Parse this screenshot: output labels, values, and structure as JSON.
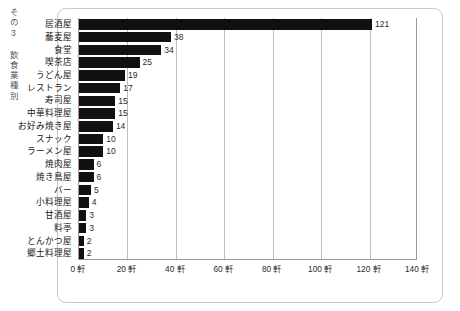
{
  "figure": {
    "side_caption": "その3 飲食業種別",
    "frame_color": "#c9c9c9",
    "bar_color": "#111111",
    "grid_color": "#bdbdbd",
    "axis_color": "#9a9a9a"
  },
  "chart_data": {
    "type": "bar",
    "orientation": "horizontal",
    "title": "その3 飲食業種別",
    "xlabel": "",
    "ylabel": "",
    "unit": "軒",
    "xlim": [
      0,
      140
    ],
    "grid": true,
    "legend": null,
    "categories": [
      "居酒屋",
      "蕎麦屋",
      "食堂",
      "喫茶店",
      "うどん屋",
      "レストラン",
      "寿司屋",
      "中華料理屋",
      "お好み焼き屋",
      "スナック",
      "ラーメン屋",
      "焼肉屋",
      "焼き鳥屋",
      "バー",
      "小料理屋",
      "甘酒屋",
      "料亭",
      "とんかつ屋",
      "郷土料理屋"
    ],
    "values": [
      121,
      38,
      34,
      25,
      19,
      17,
      15,
      15,
      14,
      10,
      10,
      6,
      6,
      5,
      4,
      3,
      3,
      2,
      2
    ],
    "value_labels": [
      "121",
      "38",
      "34",
      "25",
      "19",
      "17",
      "15",
      "15",
      "14",
      "10",
      "10",
      "6",
      "6",
      "5",
      "4",
      "3",
      "3",
      "2",
      "2"
    ],
    "xticks": [
      0,
      20,
      40,
      60,
      80,
      100,
      120,
      140
    ],
    "xtick_labels": [
      "0 軒",
      "20 軒",
      "40 軒",
      "60 軒",
      "80 軒",
      "100 軒",
      "120 軒",
      "140 軒"
    ]
  }
}
